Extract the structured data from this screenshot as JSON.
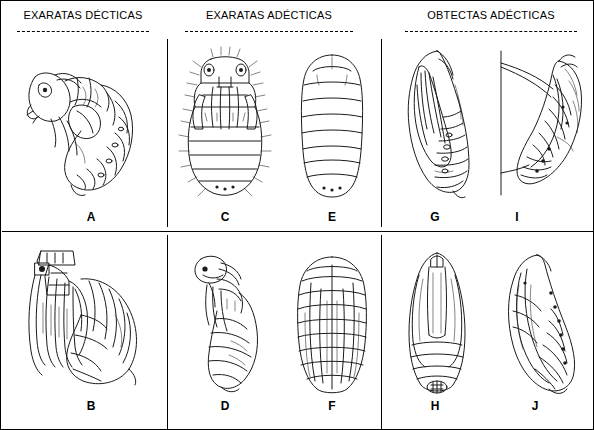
{
  "figure": {
    "background_color": "#ffffff",
    "ink_color": "#1a1a1a",
    "groups": [
      {
        "id": "group-exaratas-decticas",
        "label": "EXARATAS DÉCTICAS"
      },
      {
        "id": "group-exaratas-adecticas",
        "label": "EXARATAS ADÉCTICAS"
      },
      {
        "id": "group-obtectas-adecticas",
        "label": "OBTECTAS ADÉCTICAS"
      }
    ],
    "panels": [
      {
        "id": "panel-a",
        "label": "A",
        "group": "group-exaratas-decticas",
        "row": 1,
        "column": 1
      },
      {
        "id": "panel-b",
        "label": "B",
        "group": "group-exaratas-decticas",
        "row": 2,
        "column": 1
      },
      {
        "id": "panel-c",
        "label": "C",
        "group": "group-exaratas-adecticas",
        "row": 1,
        "column": 2
      },
      {
        "id": "panel-d",
        "label": "D",
        "group": "group-exaratas-adecticas",
        "row": 2,
        "column": 2
      },
      {
        "id": "panel-e",
        "label": "E",
        "group": "group-exaratas-adecticas",
        "row": 1,
        "column": 3
      },
      {
        "id": "panel-f",
        "label": "F",
        "group": "group-exaratas-adecticas",
        "row": 2,
        "column": 3
      },
      {
        "id": "panel-g",
        "label": "G",
        "group": "group-obtectas-adecticas",
        "row": 1,
        "column": 4
      },
      {
        "id": "panel-h",
        "label": "H",
        "group": "group-obtectas-adecticas",
        "row": 2,
        "column": 4
      },
      {
        "id": "panel-i",
        "label": "I",
        "group": "group-obtectas-adecticas",
        "row": 1,
        "column": 5
      },
      {
        "id": "panel-j",
        "label": "J",
        "group": "group-obtectas-adecticas",
        "row": 2,
        "column": 5
      }
    ]
  }
}
